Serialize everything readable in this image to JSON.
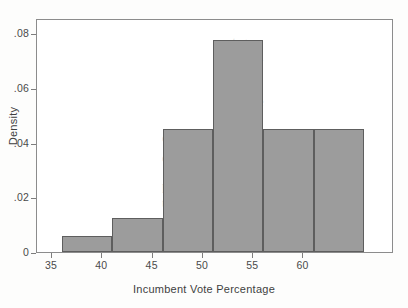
{
  "figure": {
    "background": "#ffffff",
    "bar_fill": "#9c9c9c",
    "bar_edge": "#5e5e5e",
    "axis_color": "#8c8c8c"
  },
  "chart_data": {
    "type": "bar",
    "title": "",
    "subtitle": "",
    "xlabel": "Incumbent Vote Percentage",
    "ylabel": "Density",
    "xlim": [
      33.5,
      69
    ],
    "ylim": [
      0,
      0.0855
    ],
    "grid": false,
    "legend": null,
    "bin_width": 5,
    "bin_edges": [
      36,
      41,
      46,
      51,
      56,
      61,
      66
    ],
    "categories": [
      "36-41",
      "41-46",
      "46-51",
      "51-56",
      "56-61",
      "61-66"
    ],
    "values": [
      0.006,
      0.0125,
      0.045,
      0.0775,
      0.045,
      0.045
    ],
    "xticks": [
      35,
      40,
      45,
      50,
      55,
      60
    ],
    "xticklabels": [
      "35",
      "40",
      "45",
      "50",
      "55",
      "60"
    ],
    "yticks": [
      0,
      0.02,
      0.04,
      0.06,
      0.08
    ],
    "yticklabels": [
      "0",
      ".02",
      ".04",
      ".06",
      ".08"
    ]
  },
  "bleed_through": {
    "lines": [
      "entage",
      "the story",
      "ging the",
      "es. If the",
      "orted and to keep your audience in",
      "cy the",
      "pular - variable system with our",
      "the rainbow for one possibility that",
      "eyes of a voter use a large amoun",
      "ain - to understand - key take-hom",
      "udience connection with it, will"
    ]
  }
}
